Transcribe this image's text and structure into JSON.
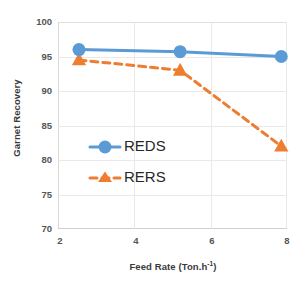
{
  "chart_data": {
    "type": "line",
    "title": "",
    "xlabel": "Feed Rate (Ton.h-1)",
    "xlabel_base": "Feed Rate (Ton.h",
    "xlabel_sup": "-1",
    "xlabel_tail": ")",
    "ylabel": "Garnet Recovery",
    "xlim": [
      2,
      8
    ],
    "ylim": [
      70,
      100
    ],
    "xticks": [
      "2",
      "4",
      "6",
      "8"
    ],
    "yticks": [
      "100",
      "95",
      "90",
      "85",
      "80",
      "75",
      "70"
    ],
    "grid": true,
    "legend_position": "center-left-inside",
    "x": [
      2.55,
      5.2,
      7.85
    ],
    "series": [
      {
        "name": "REDS",
        "values": [
          96.0,
          95.7,
          95.0
        ],
        "color": "#5B9BD5",
        "marker": "circle",
        "linestyle": "solid"
      },
      {
        "name": "RERS",
        "values": [
          94.5,
          93.0,
          82.0
        ],
        "color": "#ED7D31",
        "marker": "triangle",
        "linestyle": "dashed"
      }
    ]
  },
  "legend": {
    "items": [
      {
        "label": "REDS"
      },
      {
        "label": "RERS"
      }
    ]
  },
  "colors": {
    "series_blue": "#5B9BD5",
    "series_orange": "#ED7D31",
    "grid": "#E9E9E9",
    "text": "#555555",
    "background": "#FFFFFF"
  }
}
